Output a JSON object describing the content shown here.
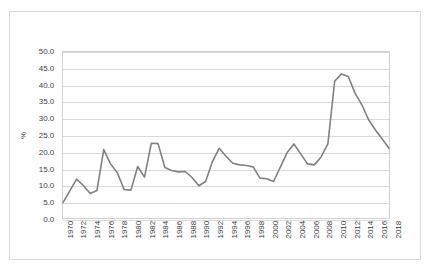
{
  "chart_data": {
    "type": "line",
    "title": "",
    "xlabel": "",
    "ylabel": "%",
    "ylim": [
      0,
      50
    ],
    "y_tick_step": 5,
    "y_ticks": [
      "0.0",
      "5.0",
      "10.0",
      "15.0",
      "20.0",
      "25.0",
      "30.0",
      "35.0",
      "40.0",
      "45.0",
      "50.0"
    ],
    "x_tick_labels": [
      "1970",
      "1972",
      "1974",
      "1976",
      "1978",
      "1980",
      "1982",
      "1984",
      "1986",
      "1988",
      "1990",
      "1992",
      "1994",
      "1996",
      "1998",
      "2000",
      "2002",
      "2004",
      "2006",
      "2008",
      "2010",
      "2012",
      "2014",
      "2016",
      "2018"
    ],
    "x_tick_step": 2,
    "xlim": [
      1970,
      2018
    ],
    "grid": true,
    "legend": false,
    "legend_position": "none",
    "series_color": "#808080",
    "gridline_color": "#d9d9d9",
    "plot_border_color": "#d0d0d0",
    "figure_border_color": "#d9d9d9",
    "background_color": "#ffffff",
    "x": [
      1970,
      1971,
      1972,
      1973,
      1974,
      1975,
      1976,
      1977,
      1978,
      1979,
      1980,
      1981,
      1982,
      1983,
      1984,
      1985,
      1986,
      1987,
      1988,
      1989,
      1990,
      1991,
      1992,
      1993,
      1994,
      1995,
      1996,
      1997,
      1998,
      1999,
      2000,
      2001,
      2002,
      2003,
      2004,
      2005,
      2006,
      2007,
      2008,
      2009,
      2010,
      2011,
      2012,
      2013,
      2014,
      2015,
      2016,
      2017,
      2018
    ],
    "values": [
      4.6,
      8.2,
      11.7,
      9.8,
      7.4,
      8.3,
      20.6,
      16.3,
      13.6,
      8.6,
      8.4,
      15.5,
      12.3,
      22.5,
      22.4,
      15.2,
      14.3,
      13.9,
      14.0,
      12.2,
      9.7,
      11.0,
      17.0,
      21.0,
      18.6,
      16.5,
      16.0,
      15.8,
      15.4,
      12.0,
      11.8,
      11.0,
      15.3,
      19.7,
      22.3,
      19.3,
      16.3,
      16.0,
      18.4,
      22.3,
      41.2,
      43.4,
      42.6,
      37.6,
      34.1,
      29.6,
      26.5,
      23.8,
      21.0
    ],
    "series": [
      {
        "name": "%",
        "values": [
          4.6,
          8.2,
          11.7,
          9.8,
          7.4,
          8.3,
          20.6,
          16.3,
          13.6,
          8.6,
          8.4,
          15.5,
          12.3,
          22.5,
          22.4,
          15.2,
          14.3,
          13.9,
          14.0,
          12.2,
          9.7,
          11.0,
          17.0,
          21.0,
          18.6,
          16.5,
          16.0,
          15.8,
          15.4,
          12.0,
          11.8,
          11.0,
          15.3,
          19.7,
          22.3,
          19.3,
          16.3,
          16.0,
          18.4,
          22.3,
          41.2,
          43.4,
          42.6,
          37.6,
          34.1,
          29.6,
          26.5,
          23.8,
          21.0
        ]
      }
    ]
  }
}
